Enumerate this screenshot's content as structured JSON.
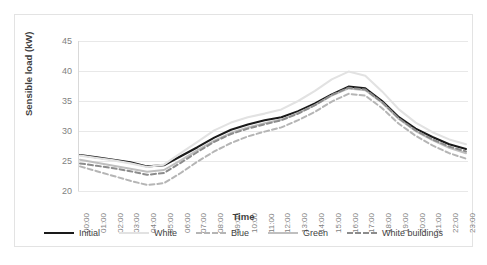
{
  "chart_data": {
    "type": "line",
    "title": "",
    "xlabel": "Time",
    "ylabel": "Sensible load (kW)",
    "ylim": [
      20,
      45
    ],
    "yticks": [
      20,
      25,
      30,
      35,
      40,
      45
    ],
    "grid": true,
    "legend_position": "bottom",
    "categories": [
      "00:00",
      "01:00",
      "02:00",
      "03:00",
      "04:00",
      "05:00",
      "06:00",
      "07:00",
      "08:00",
      "09:00",
      "10:00",
      "11:00",
      "12:00",
      "13:00",
      "14:00",
      "15:00",
      "16:00",
      "17:00",
      "18:00",
      "19:00",
      "20:00",
      "21:00",
      "22:00",
      "23:00"
    ],
    "series": [
      {
        "name": "Initial",
        "color": "#1a1a1a",
        "style": "solid",
        "width": 2.1,
        "values": [
          26.0,
          25.6,
          25.2,
          24.8,
          24.1,
          24.3,
          25.8,
          27.3,
          28.9,
          30.2,
          31.1,
          31.8,
          32.3,
          33.3,
          34.6,
          36.1,
          37.4,
          37.1,
          35.0,
          32.3,
          30.4,
          29.0,
          27.8,
          27.0
        ]
      },
      {
        "name": "White",
        "color": "#e2e2e2",
        "style": "solid",
        "width": 2.1,
        "values": [
          25.9,
          25.5,
          25.1,
          24.6,
          24.0,
          24.4,
          26.3,
          28.2,
          30.1,
          31.4,
          32.3,
          32.9,
          33.6,
          35.0,
          36.7,
          38.6,
          39.9,
          39.2,
          36.6,
          33.6,
          31.4,
          29.8,
          28.6,
          27.8
        ]
      },
      {
        "name": "Blue",
        "color": "#b5b5b5",
        "style": "dashed",
        "width": 2.0,
        "values": [
          24.1,
          23.3,
          22.5,
          21.7,
          21.0,
          21.3,
          23.0,
          24.9,
          26.6,
          28.0,
          29.1,
          29.9,
          30.6,
          31.8,
          33.2,
          34.9,
          36.2,
          35.9,
          33.8,
          31.2,
          29.2,
          27.6,
          26.3,
          25.4
        ]
      },
      {
        "name": "Green",
        "color": "#bfbfbf",
        "style": "solid",
        "width": 2.0,
        "values": [
          25.2,
          24.7,
          24.2,
          23.7,
          23.2,
          23.5,
          25.1,
          26.8,
          28.4,
          29.7,
          30.6,
          31.3,
          31.9,
          33.0,
          34.3,
          35.9,
          37.1,
          36.8,
          34.7,
          32.0,
          30.0,
          28.5,
          27.2,
          26.3
        ]
      },
      {
        "name": "White buildings",
        "color": "#8c8c8c",
        "style": "dashed",
        "width": 2.0,
        "values": [
          24.6,
          24.2,
          23.8,
          23.3,
          22.7,
          23.0,
          24.7,
          26.5,
          28.2,
          29.5,
          30.4,
          31.1,
          31.8,
          32.9,
          34.3,
          36.0,
          37.2,
          36.9,
          34.8,
          32.1,
          30.1,
          28.6,
          27.4,
          26.6
        ]
      }
    ]
  }
}
